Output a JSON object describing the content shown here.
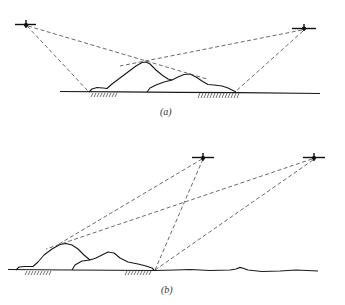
{
  "figure": {
    "panels": [
      {
        "id": "a",
        "label": "(a)",
        "aircraft": [
          {
            "name": "left-aircraft",
            "x": 26,
            "y": 25
          },
          {
            "name": "right-aircraft",
            "x": 304,
            "y": 29
          }
        ],
        "sight_lines": [
          {
            "from": "left-aircraft",
            "to": [
              90,
              92
            ]
          },
          {
            "from": "left-aircraft",
            "to": [
              207,
              79
            ]
          },
          {
            "from": "right-aircraft",
            "to": [
              120,
              65
            ]
          },
          {
            "from": "right-aircraft",
            "to": [
              235,
              92
            ]
          }
        ],
        "hatched_regions": [
          {
            "x_start": 92,
            "x_end": 118
          },
          {
            "x_start": 198,
            "x_end": 240
          }
        ]
      },
      {
        "id": "b",
        "label": "(b)",
        "aircraft": [
          {
            "name": "near-aircraft",
            "x": 203,
            "y": 158
          },
          {
            "name": "far-aircraft",
            "x": 314,
            "y": 158
          }
        ],
        "sight_lines": [
          {
            "from": "near-aircraft",
            "to": [
              60,
              244
            ]
          },
          {
            "from": "near-aircraft",
            "to": [
              155,
              270
            ]
          },
          {
            "from": "far-aircraft",
            "to": [
              48,
              247
            ]
          },
          {
            "from": "far-aircraft",
            "to": [
              155,
              270
            ]
          }
        ],
        "hatched_regions": [
          {
            "x_start": 25,
            "x_end": 50
          },
          {
            "x_start": 125,
            "x_end": 152
          }
        ]
      }
    ]
  },
  "labels": {
    "panel_a": "(a)",
    "panel_b": "(b)"
  }
}
